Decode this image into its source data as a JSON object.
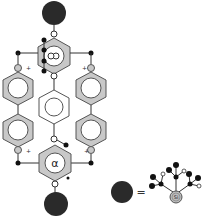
{
  "diagram": {
    "type": "molecular-structure",
    "colors": {
      "ring_fill": "#c8c8c8",
      "ring_stroke": "#555555",
      "bond": "#333333",
      "dendron": "#2a2a2a",
      "open_node": "#ffffff",
      "si_fill": "#bdbdbd"
    },
    "top_ring": {
      "label": "α"
    },
    "bottom_ring": {
      "label": "α"
    },
    "charge_labels": [
      "+",
      "+",
      "+",
      "+"
    ],
    "legend": {
      "equals": "=",
      "core_label": "Si"
    }
  }
}
